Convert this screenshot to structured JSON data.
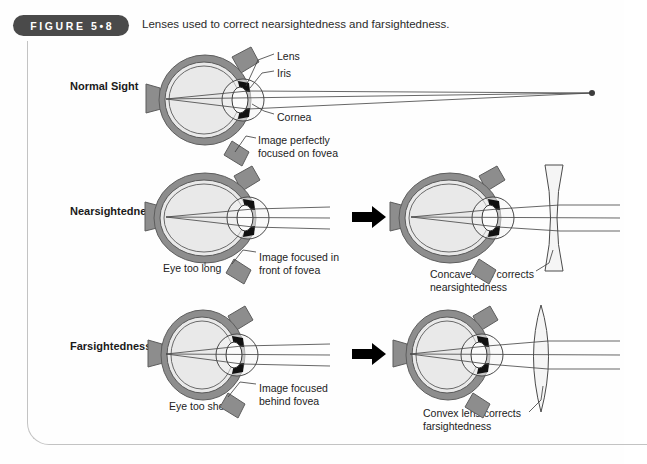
{
  "figure": {
    "badge_label": "FIGURE 5•8",
    "caption": "Lenses used to correct nearsightedness and farsightedness."
  },
  "colors": {
    "badge_background": "#4a4a4a",
    "badge_text": "#ffffff",
    "sclera": "#8d8d8d",
    "vitreous": "#e9e9e9",
    "iris": "#111111",
    "ray": "#4c4c4c",
    "frame_border": "#c3c3c3",
    "page_background": "#ffffff"
  },
  "rows": [
    {
      "id": "normal-sight",
      "label": "Normal Sight",
      "annotations": [
        {
          "id": "lens",
          "text": "Lens"
        },
        {
          "id": "iris",
          "text": "Iris"
        },
        {
          "id": "cornea",
          "text": "Cornea"
        },
        {
          "id": "focus",
          "text": "Image perfectly\nfocused on fovea"
        }
      ],
      "has_arrow": false,
      "corrective_lens": null
    },
    {
      "id": "nearsightedness",
      "label": "Nearsightedness",
      "annotations": [
        {
          "id": "eye-length",
          "text": "Eye too long"
        },
        {
          "id": "focus",
          "text": "Image focused in\nfront of fovea"
        },
        {
          "id": "correction",
          "text": "Concave lens corrects\nnearsightedness"
        }
      ],
      "has_arrow": true,
      "corrective_lens": "concave"
    },
    {
      "id": "farsightedness",
      "label": "Farsightedness",
      "annotations": [
        {
          "id": "eye-length",
          "text": "Eye too short"
        },
        {
          "id": "focus",
          "text": "Image focused\nbehind fovea"
        },
        {
          "id": "correction",
          "text": "Convex lens corrects\nfarsightedness"
        }
      ],
      "has_arrow": true,
      "corrective_lens": "convex"
    }
  ]
}
